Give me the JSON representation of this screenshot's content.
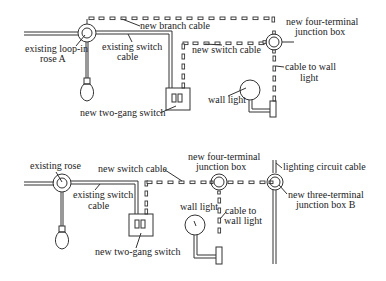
{
  "top_diagram": {
    "labels": {
      "existing_rose": [
        "existing loop-in",
        "rose A"
      ],
      "existing_switch_cable": [
        "existing switch",
        "cable"
      ],
      "new_branch_cable": "new branch cable",
      "new_switch_cable": "new switch cable",
      "junction_box": [
        "new four-terminal",
        "junction box"
      ],
      "cable_to_wall_light": [
        "cable to wall",
        "light"
      ],
      "wall_light": "wall light",
      "two_gang_switch": "new two-gang switch"
    }
  },
  "bottom_diagram": {
    "labels": {
      "existing_rose": "existing rose",
      "existing_switch_cable": [
        "existing switch",
        "cable"
      ],
      "new_switch_cable": "new switch cable",
      "junction_box": [
        "new four-terminal",
        "junction box"
      ],
      "lighting_circuit_cable": "lighting circuit cable",
      "three_terminal_box": [
        "new three-terminal",
        "junction box B"
      ],
      "wall_light": "wall light",
      "cable_to_wall_light": [
        "cable to",
        "wall light"
      ],
      "two_gang_switch": "new two-gang switch"
    }
  },
  "colors": {
    "line": "#333333",
    "background": "#ffffff"
  }
}
